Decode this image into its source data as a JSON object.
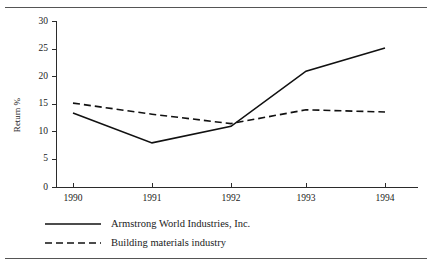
{
  "chart_data": {
    "type": "line",
    "title": "",
    "xlabel": "",
    "ylabel": "Return %",
    "x": [
      "1990",
      "1991",
      "1992",
      "1993",
      "1994"
    ],
    "categories": [
      "1990",
      "1991",
      "1992",
      "1993",
      "1994"
    ],
    "ylim": [
      0,
      30
    ],
    "yticks": [
      0,
      5,
      10,
      15,
      20,
      25,
      30
    ],
    "ytick_labels": [
      "0",
      "5",
      "10",
      "15",
      "20",
      "25",
      "30"
    ],
    "grid": false,
    "legend_position": "below-left",
    "series": [
      {
        "name": "Armstrong World Industries, Inc.",
        "style": "solid",
        "color": "#111111",
        "values": [
          13.4,
          8.0,
          11.0,
          21.0,
          25.2
        ]
      },
      {
        "name": "Building materials industry",
        "style": "dashed",
        "color": "#111111",
        "values": [
          15.2,
          13.2,
          11.5,
          14.0,
          13.6
        ]
      }
    ]
  },
  "axes": {
    "y_title": "Return %",
    "y_tick_labels": [
      "30",
      "25",
      "20",
      "15",
      "10",
      "5",
      "0"
    ],
    "x_tick_labels": [
      "1990",
      "1991",
      "1992",
      "1993",
      "1994"
    ]
  },
  "legend": {
    "entries": [
      {
        "label": "Armstrong World Industries, Inc.",
        "style": "solid"
      },
      {
        "label": "Building materials industry",
        "style": "dashed"
      }
    ]
  }
}
